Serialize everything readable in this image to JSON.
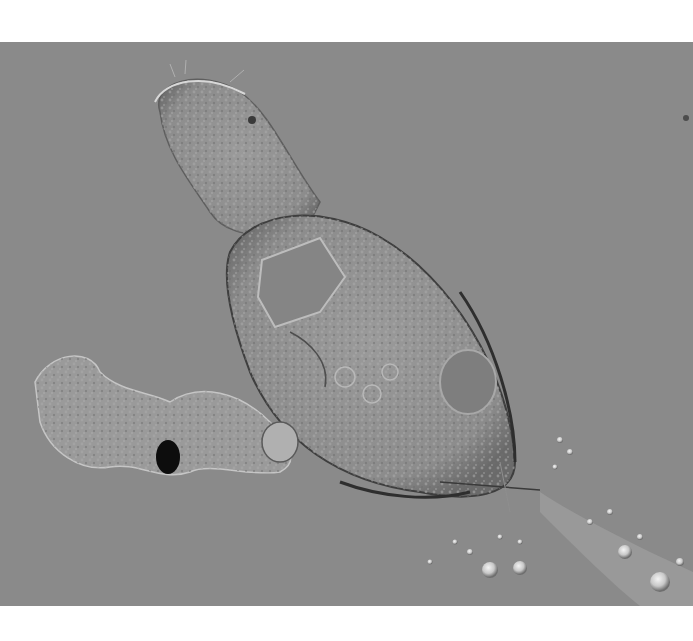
{
  "image": {
    "kind": "DIC micrograph",
    "subject": "rotifer-like microorganism",
    "background_color": "#8a8a8a",
    "page_background": "#ffffff",
    "frame": {
      "x": 0,
      "y": 42,
      "width": 693,
      "height": 564
    }
  },
  "regions": [
    {
      "name": "head",
      "desc": "rounded ciliated head at upper left"
    },
    {
      "name": "body",
      "desc": "large oval granular trunk"
    },
    {
      "name": "inner-organ",
      "desc": "rectangular mastax-like structure"
    },
    {
      "name": "egg",
      "desc": "round vesicle near right side of body"
    },
    {
      "name": "debris-cluster",
      "desc": "granular debris left with dark particle"
    },
    {
      "name": "droplets",
      "desc": "bright beads trailing to lower right"
    }
  ]
}
